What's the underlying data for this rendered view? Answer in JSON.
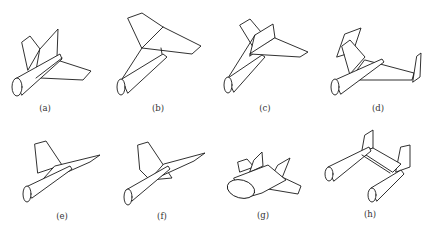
{
  "figure": {
    "type": "aircraft-configuration-line-drawings",
    "panels": [
      {
        "id": "a",
        "label": "(a)"
      },
      {
        "id": "b",
        "label": "(b)"
      },
      {
        "id": "c",
        "label": "(c)"
      },
      {
        "id": "d",
        "label": "(d)"
      },
      {
        "id": "e",
        "label": "(e)"
      },
      {
        "id": "f",
        "label": "(f)"
      },
      {
        "id": "g",
        "label": "(g)"
      },
      {
        "id": "h",
        "label": "(h)"
      }
    ],
    "caption": "",
    "caption_note": "caption partially cut off at bottom edge, not legible"
  },
  "colors": {
    "line": "#1a1a1a",
    "background": "#ffffff",
    "label": "#333333"
  }
}
